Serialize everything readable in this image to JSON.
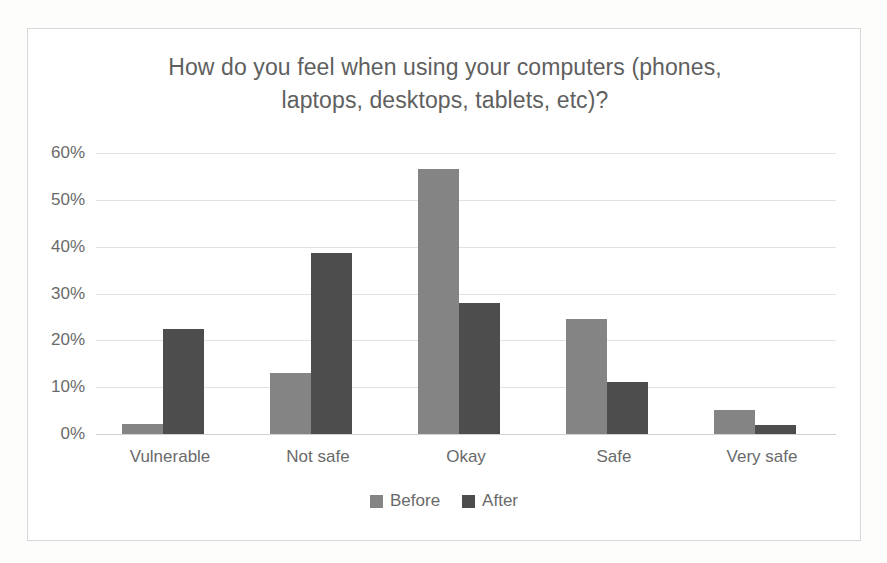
{
  "chart_data": {
    "type": "bar",
    "title": "How do you feel when using your computers (phones, laptops, desktops, tablets, etc)?",
    "title_line1": "How do you feel when using your computers (phones,",
    "title_line2": "laptops, desktops, tablets, etc)?",
    "xlabel": "",
    "ylabel": "",
    "categories": [
      "Vulnerable",
      "Not safe",
      "Okay",
      "Safe",
      "Very safe"
    ],
    "series": [
      {
        "name": "Before",
        "color": "#848484",
        "values": [
          2.2,
          13.0,
          56.5,
          24.6,
          5.2
        ]
      },
      {
        "name": "After",
        "color": "#4d4d4d",
        "values": [
          22.5,
          38.6,
          28.0,
          11.2,
          2.0
        ]
      }
    ],
    "ylim": [
      0,
      60
    ],
    "yticks": [
      60,
      50,
      40,
      30,
      20,
      10,
      0
    ],
    "ytick_labels": [
      "60%",
      "50%",
      "40%",
      "30%",
      "20%",
      "10%",
      "0%"
    ],
    "grid": true,
    "legend_position": "bottom",
    "value_suffix": "%"
  },
  "colors": {
    "before": "#848484",
    "after": "#4d4d4d",
    "gridline": "#e2e2e2",
    "frame": "#d8d8d8",
    "text": "#6a6a6a"
  }
}
